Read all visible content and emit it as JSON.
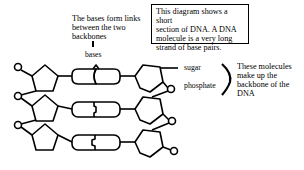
{
  "diagram": {
    "info_box": {
      "lines": [
        "This diagram shows a short",
        "section of DNA.  A DNA",
        "molecule is a very long",
        "strand of base pairs."
      ]
    },
    "bases_note": {
      "lines": [
        "The bases form links",
        "between the two",
        "backbones"
      ]
    },
    "labels": {
      "bases": "bases",
      "sugar": "sugar",
      "phosphate": "phosphate"
    },
    "backbone_note": {
      "lines": [
        "These molecules",
        "make up the",
        "backbone of the",
        "DNA"
      ]
    },
    "structure": {
      "base_pairs": 3,
      "left_backbone": [
        "sugar",
        "sugar",
        "sugar"
      ],
      "right_backbone": [
        "sugar",
        "sugar",
        "sugar"
      ],
      "phosphates_left": 3,
      "phosphates_right": 3
    },
    "colors": {
      "stroke": "#000000",
      "background": "#ffffff"
    }
  }
}
